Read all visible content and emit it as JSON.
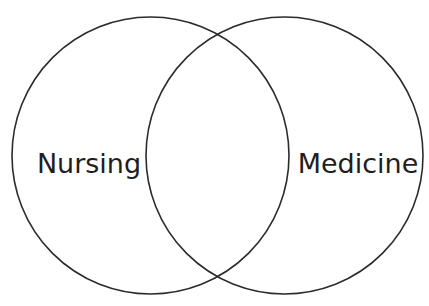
{
  "diagram": {
    "type": "venn",
    "sets": [
      {
        "id": "nursing",
        "label": "Nursing",
        "cx": 150.5,
        "cy": 155.5,
        "r": 138.5,
        "label_x": 89,
        "label_y": 173
      },
      {
        "id": "medicine",
        "label": "Medicine",
        "cx": 284.5,
        "cy": 155.5,
        "r": 138.5,
        "label_x": 358,
        "label_y": 173
      }
    ],
    "overlap_label": "",
    "stroke_color": "#2b2b2b",
    "background_color": "#ffffff"
  }
}
